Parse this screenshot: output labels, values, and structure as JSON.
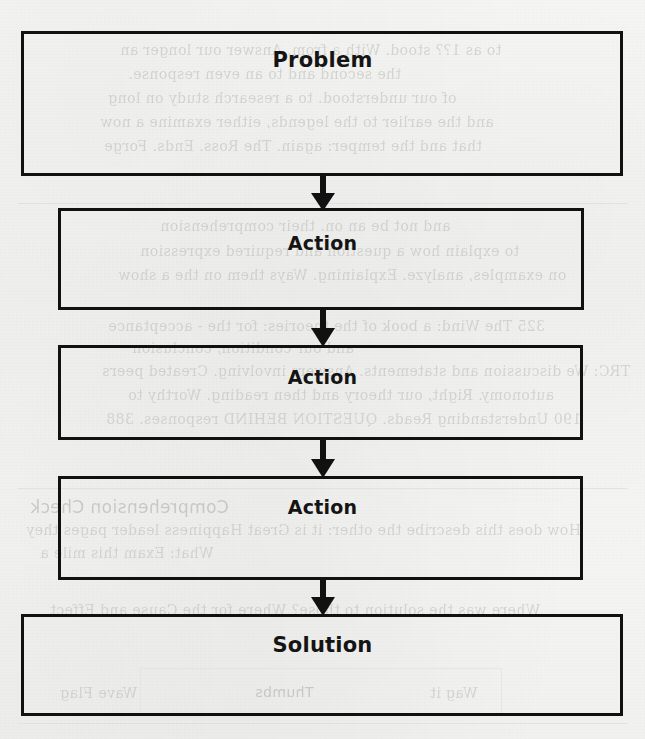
{
  "diagram": {
    "type": "flowchart",
    "orientation": "vertical-top-to-bottom",
    "stroke_color": "#111111",
    "text_color": "#141414",
    "background_color": "#f5f5f3",
    "nodes": [
      {
        "id": "problem",
        "label": "Problem",
        "shape": "rectangle",
        "x": 21,
        "y": 31,
        "width": 602,
        "height": 145,
        "label_top": 48,
        "font_size": 21
      },
      {
        "id": "action-1",
        "label": "Action",
        "shape": "rectangle",
        "x": 58,
        "y": 208,
        "width": 526,
        "height": 102,
        "label_top": 232,
        "font_size": 19
      },
      {
        "id": "action-2",
        "label": "Action",
        "shape": "rectangle",
        "x": 58,
        "y": 345,
        "width": 525,
        "height": 95,
        "label_top": 366,
        "font_size": 19
      },
      {
        "id": "action-3",
        "label": "Action",
        "shape": "rectangle",
        "x": 58,
        "y": 476,
        "width": 525,
        "height": 104,
        "label_top": 496,
        "font_size": 19
      },
      {
        "id": "solution",
        "label": "Solution",
        "shape": "rectangle",
        "x": 21,
        "y": 614,
        "width": 602,
        "height": 102,
        "label_top": 633,
        "font_size": 21
      }
    ],
    "connectors": [
      {
        "id": "problem-to-action-1",
        "from": "problem",
        "to": "action-1",
        "kind": "arrow-down",
        "x": 308,
        "y": 174,
        "width": 30,
        "height": 38
      },
      {
        "id": "action-1-to-action-2",
        "from": "action-1",
        "to": "action-2",
        "kind": "arrow-down",
        "x": 308,
        "y": 307,
        "width": 30,
        "height": 41
      },
      {
        "id": "action-2-to-action-3",
        "from": "action-2",
        "to": "action-3",
        "kind": "arrow-down",
        "x": 308,
        "y": 437,
        "width": 30,
        "height": 42
      },
      {
        "id": "action-3-to-solution",
        "from": "action-3",
        "to": "solution",
        "kind": "arrow-down",
        "x": 308,
        "y": 577,
        "width": 30,
        "height": 40
      }
    ]
  },
  "background": {
    "description": "faint bleed-through text from the reverse side of a scanned book page",
    "headings": [
      {
        "text": "Comprehension Check",
        "x": 30,
        "y": 497,
        "size": 17
      },
      {
        "text": "Thumbs",
        "x": 255,
        "y": 684,
        "size": 14
      }
    ],
    "lines": [
      {
        "text": "to as 1?? stood. With a from. Answer our longer an",
        "x": 120,
        "y": 42,
        "size": 14
      },
      {
        "text": "the second and to an even response.",
        "x": 128,
        "y": 66,
        "size": 14
      },
      {
        "text": "of our understood. to a research study on long",
        "x": 108,
        "y": 90,
        "size": 14
      },
      {
        "text": "and the earlier to the legends, either examine a now",
        "x": 100,
        "y": 114,
        "size": 14
      },
      {
        "text": "that and the temper: again. The Ross. Ends. Forge",
        "x": 104,
        "y": 138,
        "size": 14
      },
      {
        "text": "and not be an on. their comprehension",
        "x": 160,
        "y": 218,
        "size": 14
      },
      {
        "text": "to explain how a question and required expression",
        "x": 140,
        "y": 243,
        "size": 14
      },
      {
        "text": "on examples, analyze. Explaining. Ways them on the a show",
        "x": 118,
        "y": 267,
        "size": 14
      },
      {
        "text": "325  The Wind: a book of the theories: for the - acceptance",
        "x": 108,
        "y": 318,
        "size": 14
      },
      {
        "text": "and our condition, conclusion",
        "x": 132,
        "y": 340,
        "size": 14
      },
      {
        "text": "TRC:     We discussion and statements. Answers involving. Created peers",
        "x": 102,
        "y": 363,
        "size": 14
      },
      {
        "text": "autonomy. Right, our theory and then reading. Worthy to",
        "x": 128,
        "y": 387,
        "size": 14
      },
      {
        "text": "190  Understanding Reads. QUESTION BEHIND responses. 388",
        "x": 106,
        "y": 411,
        "size": 14
      },
      {
        "text": "How does this describe the other: it is Great Happiness leader  pages they",
        "x": 26,
        "y": 522,
        "size": 14
      },
      {
        "text": "What: Exam this mile a",
        "x": 40,
        "y": 545,
        "size": 14
      },
      {
        "text": "Where was the solution to those? Where for the Cause and Effect",
        "x": 50,
        "y": 602,
        "size": 14
      },
      {
        "text": "Wave Flag",
        "x": 60,
        "y": 685,
        "size": 14
      },
      {
        "text": "Wag it",
        "x": 430,
        "y": 685,
        "size": 14
      }
    ],
    "rules": [
      {
        "x": 18,
        "y": 203,
        "width": 610
      },
      {
        "x": 18,
        "y": 488,
        "width": 610
      },
      {
        "x": 18,
        "y": 723,
        "width": 610
      }
    ],
    "boxes": [
      {
        "x": 140,
        "y": 668,
        "width": 360,
        "height": 46
      }
    ]
  }
}
